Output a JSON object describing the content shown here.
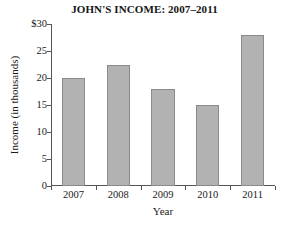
{
  "chart_data": {
    "type": "bar",
    "title": "JOHN'S INCOME: 2007–2011",
    "xlabel": "Year",
    "ylabel": "Income  (in thousands)",
    "categories": [
      "2007",
      "2008",
      "2009",
      "2010",
      "2011"
    ],
    "values": [
      20,
      22.5,
      18,
      15,
      28
    ],
    "ylim": [
      0,
      30
    ],
    "ytick_values": [
      0,
      5,
      10,
      15,
      20,
      25,
      30
    ],
    "ytick_labels": [
      "0",
      "5",
      "10",
      "15",
      "20",
      "25",
      "$30"
    ],
    "grid": false,
    "legend": null,
    "bar_fill_color": "#b2b2b2",
    "bar_edge_color": "#8a8a8a",
    "axis_color": "#555555",
    "background_color": "#ffffff",
    "series": [
      {
        "name": "Income",
        "values": [
          20,
          22.5,
          18,
          15,
          28
        ]
      }
    ]
  }
}
